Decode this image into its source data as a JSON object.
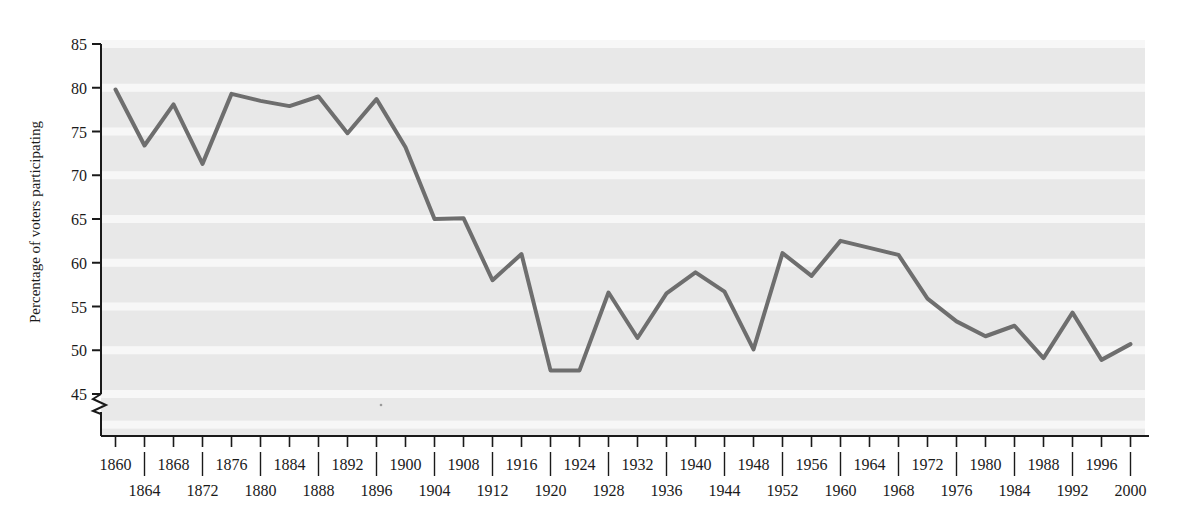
{
  "chart_data": {
    "type": "line",
    "title": "",
    "subtitle": "",
    "xlabel": "",
    "ylabel": "Percentage of voters participating",
    "xlim": [
      1858,
      2002
    ],
    "ylim": [
      44,
      85
    ],
    "grid": true,
    "grid_style": "horizontal-banded",
    "axis_break": {
      "present": true,
      "below": 45,
      "shape": "zigzag"
    },
    "legend": {
      "present": false,
      "position": "none"
    },
    "y_ticks": [
      45,
      50,
      55,
      60,
      65,
      70,
      75,
      80,
      85
    ],
    "y_tick_labels": [
      "45",
      "50",
      "55",
      "60",
      "65",
      "70",
      "75",
      "80",
      "85"
    ],
    "x_ticks": [
      1860,
      1864,
      1868,
      1872,
      1876,
      1880,
      1884,
      1888,
      1892,
      1896,
      1900,
      1904,
      1908,
      1912,
      1916,
      1920,
      1924,
      1928,
      1932,
      1936,
      1940,
      1944,
      1948,
      1952,
      1956,
      1960,
      1964,
      1968,
      1972,
      1976,
      1980,
      1984,
      1988,
      1992,
      1996,
      2000
    ],
    "x_tick_labels_row1": [
      "1860",
      "1868",
      "1876",
      "1884",
      "1892",
      "1900",
      "1908",
      "1916",
      "1924",
      "1932",
      "1940",
      "1948",
      "1956",
      "1964",
      "1972",
      "1980",
      "1988",
      "1996"
    ],
    "x_tick_labels_row2": [
      "1864",
      "1872",
      "1880",
      "1888",
      "1896",
      "1904",
      "1912",
      "1920",
      "1928",
      "1936",
      "1944",
      "1952",
      "1960",
      "1968",
      "1976",
      "1984",
      "1992",
      "2000"
    ],
    "x": [
      1860,
      1864,
      1868,
      1872,
      1876,
      1880,
      1884,
      1888,
      1892,
      1896,
      1900,
      1904,
      1908,
      1912,
      1916,
      1920,
      1924,
      1928,
      1932,
      1936,
      1940,
      1944,
      1948,
      1952,
      1956,
      1960,
      1964,
      1968,
      1972,
      1976,
      1980,
      1984,
      1988,
      1992,
      1996,
      2000
    ],
    "values": [
      79.8,
      73.4,
      78.1,
      71.3,
      79.3,
      78.5,
      77.9,
      79.0,
      74.8,
      78.7,
      73.2,
      65.0,
      65.1,
      58.0,
      61.0,
      47.7,
      47.7,
      56.6,
      51.4,
      56.5,
      58.9,
      56.7,
      50.1,
      61.1,
      58.5,
      62.5,
      61.7,
      60.9,
      55.9,
      53.3,
      51.6,
      52.8,
      49.1,
      54.3,
      48.9,
      50.7
    ],
    "series": [
      {
        "name": "Percentage of voters participating",
        "color": "#6e6e6e",
        "line_width": 4,
        "values": [
          79.8,
          73.4,
          78.1,
          71.3,
          79.3,
          78.5,
          77.9,
          79.0,
          74.8,
          78.7,
          73.2,
          65.0,
          65.1,
          58.0,
          61.0,
          47.7,
          47.7,
          56.6,
          51.4,
          56.5,
          58.9,
          56.7,
          50.1,
          61.1,
          58.5,
          62.5,
          61.7,
          60.9,
          55.9,
          53.3,
          51.6,
          52.8,
          49.1,
          54.3,
          48.9,
          50.7
        ]
      }
    ]
  },
  "colors": {
    "line": "#6e6e6e",
    "plot_background": "#e8e8e8",
    "grid_band": "#f7f7f7",
    "axis": "#1a1a1a",
    "text": "#1a1a1a",
    "page_background": "#ffffff"
  },
  "axis_titles": {
    "y": "Percentage of voters participating"
  }
}
